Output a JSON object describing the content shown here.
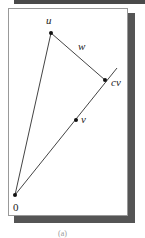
{
  "diagram": {
    "labels": {
      "u": "u",
      "w": "w",
      "cv": "cv",
      "v": "v",
      "origin": "0"
    },
    "points": {
      "origin": [
        15,
        195
      ],
      "u": [
        51,
        33
      ],
      "v": [
        76,
        120
      ],
      "cv": [
        105,
        80
      ],
      "ray_end": [
        117,
        68
      ]
    },
    "caption": "(a)"
  },
  "colors": {
    "line": "#444444",
    "shadow": "#555555",
    "frame_border": "#999999"
  }
}
